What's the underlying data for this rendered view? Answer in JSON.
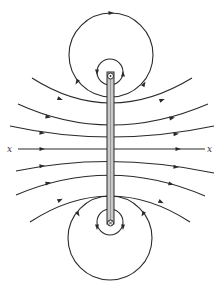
{
  "figure": {
    "axis_label_left": "x",
    "axis_label_right": "x",
    "colors": {
      "line": "#2a2a2a",
      "strip_fill": "#c8c8c8",
      "background": "#ffffff"
    },
    "field_lines_above_axis": 3,
    "field_lines_below_axis": 3,
    "loops_per_conductor": 2,
    "conductors": [
      {
        "name": "top-conductor",
        "symbol": "dot"
      },
      {
        "name": "bottom-conductor",
        "symbol": "cross"
      }
    ]
  }
}
